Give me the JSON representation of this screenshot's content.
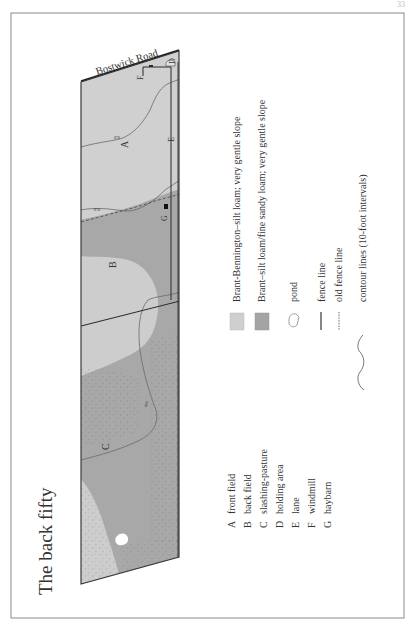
{
  "page_number": "33",
  "title": "The back fifty",
  "map": {
    "road_label": "Bostwick Road",
    "field_labels": [
      "A",
      "B",
      "C",
      "D",
      "E",
      "F",
      "G"
    ],
    "contour_labels": [
      "870",
      "870",
      "860"
    ],
    "colors": {
      "light_soil": "#cfcfcf",
      "dark_soil": "#a6a6a6",
      "mid_soil": "#b9b9b9",
      "fence": "#2b2b2b",
      "contour": "#6a6a6a",
      "frame": "#7a7a7a"
    }
  },
  "legend": {
    "keys": [
      {
        "letter": "A",
        "label": "front field"
      },
      {
        "letter": "B",
        "label": "back field"
      },
      {
        "letter": "C",
        "label": "slashing-pasture"
      },
      {
        "letter": "D",
        "label": "holding area"
      },
      {
        "letter": "E",
        "label": "lane"
      },
      {
        "letter": "F",
        "label": "windmill"
      },
      {
        "letter": "G",
        "label": "haybarn"
      }
    ],
    "symbols": [
      {
        "symbol": "light-swatch",
        "label": "Brant-Bennington–silt loam; very gentle slope"
      },
      {
        "symbol": "dark-swatch",
        "label": "Brant–silt loam/fine sandy loam; very gentle slope"
      },
      {
        "symbol": "pond",
        "label": "pond"
      },
      {
        "symbol": "fence-line",
        "label": "fence line"
      },
      {
        "symbol": "old-fence-line",
        "label": "old fence line"
      },
      {
        "symbol": "contour-line",
        "label": "contour lines (10-foot intervals)"
      }
    ]
  }
}
